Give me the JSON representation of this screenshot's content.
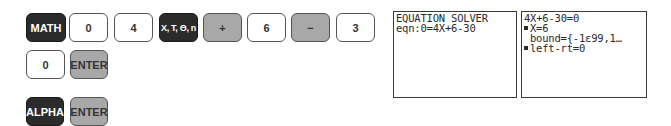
{
  "keystrokes": {
    "row1": [
      {
        "label": "MATH",
        "style": "dark"
      },
      {
        "label": "0",
        "style": "light"
      },
      {
        "label": "4",
        "style": "light"
      },
      {
        "label": "X, T, Θ, n",
        "style": "dark"
      },
      {
        "label": "+",
        "style": "gray"
      },
      {
        "label": "6",
        "style": "light"
      },
      {
        "label": "−",
        "style": "gray"
      },
      {
        "label": "3",
        "style": "light"
      }
    ],
    "row2": [
      {
        "label": "0",
        "style": "light"
      },
      {
        "label": "ENTER",
        "style": "gray"
      }
    ],
    "row3": [
      {
        "label": "ALPHA",
        "style": "dark"
      },
      {
        "label": "ENTER",
        "style": "gray"
      }
    ]
  },
  "screens": {
    "solver_entry": {
      "lines": [
        "EQUATION SOLVER",
        "eqn:0=4X+6-30"
      ]
    },
    "solver_result": {
      "equation": "4X+6-30=0",
      "solution": "X=6",
      "bound": "bound={-1ε99,1…",
      "left_rt": "left-rt=0"
    }
  },
  "colors": {
    "dark_key": "#2b2b2b",
    "gray_key": "#a8a8a8",
    "light_key": "#ffffff",
    "screen_border": "#3a3a3a"
  }
}
